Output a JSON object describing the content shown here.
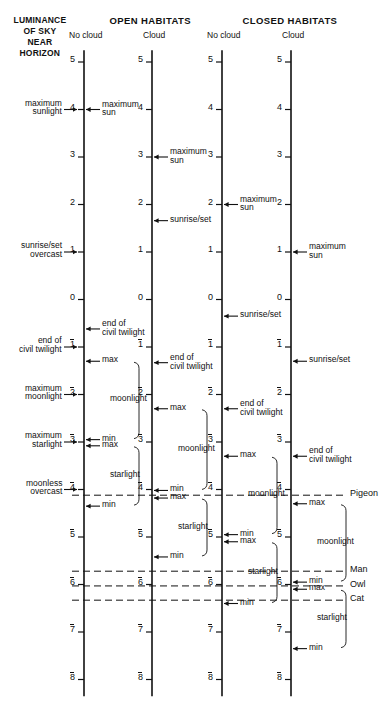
{
  "figure": {
    "title_left": [
      "LUMINANCE",
      "OF SKY",
      "NEAR",
      "HORIZON"
    ],
    "group_headers": [
      {
        "label": "OPEN HABITATS",
        "x": 150
      },
      {
        "label": "CLOSED HABITATS",
        "x": 290
      }
    ],
    "columns": [
      {
        "id": "open-no-cloud",
        "sub": "No cloud",
        "axis_x": 84
      },
      {
        "id": "open-cloud",
        "sub": "Cloud",
        "axis_x": 152
      },
      {
        "id": "closed-no-cloud",
        "sub": "No cloud",
        "axis_x": 222
      },
      {
        "id": "closed-cloud",
        "sub": "Cloud",
        "axis_x": 291
      }
    ],
    "axis": {
      "ticks": [
        5,
        4,
        3,
        2,
        1,
        0,
        -1,
        -2,
        -3,
        -4,
        -5,
        -6,
        -7,
        -8
      ],
      "tick_labels": [
        "5",
        "4",
        "3",
        "2",
        "1",
        "0",
        "1",
        "2",
        "3",
        "4",
        "5",
        "6",
        "7",
        "8"
      ],
      "negative_overbar": true,
      "y_top_value": 5,
      "y_top_px": 62,
      "px_per_unit": 47.5
    },
    "left_annotations": [
      {
        "label": "maximum\nsunlight",
        "value": 4
      },
      {
        "label": "sunrise/set\novercast",
        "value": 1
      },
      {
        "label": "end of\ncivil twilight",
        "value": -1
      },
      {
        "label": "maximum\nmoonlight",
        "value": -2
      },
      {
        "label": "maximum\nstarlight",
        "value": -3
      },
      {
        "label": "moonless\novercast",
        "value": -4
      }
    ],
    "column_annotations": [
      {
        "column": 0,
        "items": [
          {
            "label": "maximum\nsun",
            "value": 4,
            "marker": "arrow"
          },
          {
            "label": "end of\ncivil twilight",
            "value": -0.62,
            "marker": "arrow"
          },
          {
            "label": "max",
            "value": -1.3,
            "marker": "arrow"
          },
          {
            "label": "min",
            "value": -2.95,
            "marker": "arrow"
          },
          {
            "label": "max",
            "value": -3.08,
            "marker": "arrow"
          },
          {
            "label": "min",
            "value": -4.35,
            "marker": "arrow"
          }
        ],
        "brackets": [
          {
            "label": "moonlight",
            "from": -1.3,
            "to": -2.95
          },
          {
            "label": "starlight",
            "from": -3.08,
            "to": -4.35
          }
        ]
      },
      {
        "column": 1,
        "items": [
          {
            "label": "maximum\nsun",
            "value": 3,
            "marker": "arrow"
          },
          {
            "label": "sunrise/set",
            "value": 1.66,
            "marker": "arrow"
          },
          {
            "label": "end of\ncivil twilight",
            "value": -1.33,
            "marker": "arrow"
          },
          {
            "label": "max",
            "value": -2.3,
            "marker": "arrow"
          },
          {
            "label": "min",
            "value": -4.02,
            "marker": "arrow"
          },
          {
            "label": "max",
            "value": -4.18,
            "marker": "arrow"
          },
          {
            "label": "min",
            "value": -5.42,
            "marker": "arrow"
          }
        ],
        "brackets": [
          {
            "label": "moonlight",
            "from": -2.3,
            "to": -4.02
          },
          {
            "label": "starlight",
            "from": -4.18,
            "to": -5.42
          }
        ]
      },
      {
        "column": 2,
        "items": [
          {
            "label": "maximum\nsun",
            "value": 2,
            "marker": "arrow"
          },
          {
            "label": "sunrise/set",
            "value": -0.35,
            "marker": "arrow"
          },
          {
            "label": "end of\ncivil twilight",
            "value": -2.3,
            "marker": "arrow"
          },
          {
            "label": "max",
            "value": -3.3,
            "marker": "arrow"
          },
          {
            "label": "min",
            "value": -4.95,
            "marker": "arrow"
          },
          {
            "label": "max",
            "value": -5.1,
            "marker": "arrow"
          },
          {
            "label": "min",
            "value": -6.4,
            "marker": "arrow"
          }
        ],
        "brackets": [
          {
            "label": "moonlight",
            "from": -3.3,
            "to": -4.95
          },
          {
            "label": "starlight",
            "from": -5.1,
            "to": -6.4
          }
        ]
      },
      {
        "column": 3,
        "items": [
          {
            "label": "maximum\nsun",
            "value": 1,
            "marker": "arrow"
          },
          {
            "label": "sunrise/set",
            "value": -1.3,
            "marker": "arrow"
          },
          {
            "label": "end of\ncivil twilight",
            "value": -3.3,
            "marker": "arrow"
          },
          {
            "label": "max",
            "value": -4.3,
            "marker": "arrow"
          },
          {
            "label": "min",
            "value": -5.95,
            "marker": "arrow"
          },
          {
            "label": "max",
            "value": -6.1,
            "marker": "arrow"
          },
          {
            "label": "min",
            "value": -7.35,
            "marker": "arrow"
          }
        ],
        "brackets": [
          {
            "label": "moonlight",
            "from": -4.3,
            "to": -5.95
          },
          {
            "label": "starlight",
            "from": -6.1,
            "to": -7.35
          }
        ]
      }
    ],
    "threshold_lines": [
      {
        "species": "Pigeon",
        "value": -4.12
      },
      {
        "species": "Man",
        "value": -5.72
      },
      {
        "species": "Owl",
        "value": -6.03
      },
      {
        "species": "Cat",
        "value": -6.33
      }
    ]
  },
  "chart_data": {
    "type": "line",
    "ylabel": "log luminance (relative units)",
    "ylim": [
      -8,
      5
    ],
    "axis_note": "Four vertical log-luminance scales, offset between habitat/cloud conditions",
    "categories": [
      "OPEN HABITATS / No cloud",
      "OPEN HABITATS / Cloud",
      "CLOSED HABITATS / No cloud",
      "CLOSED HABITATS / Cloud"
    ],
    "series": [
      {
        "name": "maximum sun",
        "values": [
          4,
          3,
          2,
          1
        ]
      },
      {
        "name": "sunrise/set",
        "values": [
          1,
          1.66,
          -0.35,
          -1.3
        ]
      },
      {
        "name": "end of civil twilight",
        "values": [
          -0.62,
          -1.33,
          -2.3,
          -3.3
        ]
      },
      {
        "name": "moonlight max",
        "values": [
          -1.3,
          -2.3,
          -3.3,
          -4.3
        ]
      },
      {
        "name": "moonlight min",
        "values": [
          -2.95,
          -4.02,
          -4.95,
          -5.95
        ]
      },
      {
        "name": "starlight max",
        "values": [
          -3.08,
          -4.18,
          -5.1,
          -6.1
        ]
      },
      {
        "name": "starlight min",
        "values": [
          -4.35,
          -5.42,
          -6.4,
          -7.35
        ]
      }
    ],
    "thresholds": [
      {
        "name": "Pigeon",
        "value": -4.12
      },
      {
        "name": "Man",
        "value": -5.72
      },
      {
        "name": "Owl",
        "value": -6.03
      },
      {
        "name": "Cat",
        "value": -6.33
      }
    ]
  }
}
